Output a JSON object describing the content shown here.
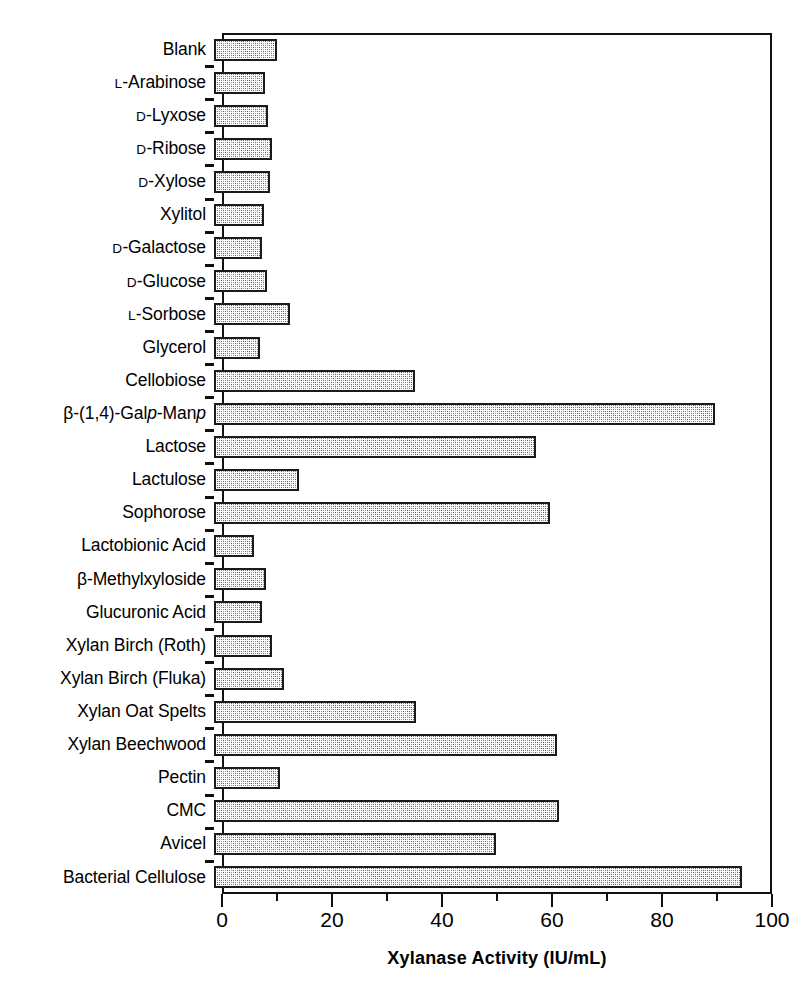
{
  "chart_data": {
    "type": "bar",
    "orientation": "horizontal",
    "title": "",
    "xlabel": "Xylanase Activity (IU/mL)",
    "ylabel": "",
    "xlim": [
      0,
      100
    ],
    "xticks": [
      0,
      20,
      40,
      60,
      80,
      100
    ],
    "xtick_labels": [
      "0",
      "20",
      "40",
      "60",
      "80",
      "100"
    ],
    "minor_xticks": [
      10,
      30,
      50,
      70,
      90
    ],
    "grid": false,
    "legend": null,
    "categories": [
      "Blank",
      "L-Arabinose",
      "D-Lyxose",
      "D-Ribose",
      "D-Xylose",
      "Xylitol",
      "D-Galactose",
      "D-Glucose",
      "L-Sorbose",
      "Glycerol",
      "Cellobiose",
      "β-(1,4)-Galp-Manp",
      "Lactose",
      "Lactulose",
      "Sophorose",
      "Lactobionic Acid",
      "β-Methylxyloside",
      "Glucuronic Acid",
      "Xylan Birch (Roth)",
      "Xylan Birch (Fluka)",
      "Xylan Oat Spelts",
      "Xylan Beechwood",
      "Pectin",
      "CMC",
      "Avicel",
      "Bacterial Cellulose"
    ],
    "values": [
      11.5,
      9.3,
      9.8,
      10.6,
      10.2,
      9.0,
      8.7,
      9.6,
      13.8,
      8.4,
      36.5,
      91.0,
      58.5,
      15.5,
      61.0,
      7.2,
      9.4,
      8.8,
      10.5,
      12.8,
      36.8,
      62.3,
      12.0,
      62.8,
      51.3,
      96.0
    ],
    "series_name": "Xylanase Activity",
    "bar_face_color": "#8e8e8e",
    "bar_edge_color": "#1a1a1a",
    "bar_pattern": "checkerboard"
  },
  "labels": [
    {
      "prefix": "",
      "prefix_smallcaps": false,
      "text": "Blank",
      "italic_chars": []
    },
    {
      "prefix": "L",
      "prefix_smallcaps": true,
      "text": "-Arabinose",
      "italic_chars": []
    },
    {
      "prefix": "D",
      "prefix_smallcaps": true,
      "text": "-Lyxose",
      "italic_chars": []
    },
    {
      "prefix": "D",
      "prefix_smallcaps": true,
      "text": "-Ribose",
      "italic_chars": []
    },
    {
      "prefix": "D",
      "prefix_smallcaps": true,
      "text": "-Xylose",
      "italic_chars": []
    },
    {
      "prefix": "",
      "prefix_smallcaps": false,
      "text": "Xylitol",
      "italic_chars": []
    },
    {
      "prefix": "D",
      "prefix_smallcaps": true,
      "text": "-Galactose",
      "italic_chars": []
    },
    {
      "prefix": "D",
      "prefix_smallcaps": true,
      "text": "-Glucose",
      "italic_chars": []
    },
    {
      "prefix": "L",
      "prefix_smallcaps": true,
      "text": "-Sorbose",
      "italic_chars": []
    },
    {
      "prefix": "",
      "prefix_smallcaps": false,
      "text": "Glycerol",
      "italic_chars": []
    },
    {
      "prefix": "",
      "prefix_smallcaps": false,
      "text": "Cellobiose",
      "italic_chars": []
    },
    {
      "prefix": "",
      "prefix_smallcaps": false,
      "text": "β-(1,4)-Galp-Manp",
      "italic_chars": [
        "p"
      ]
    },
    {
      "prefix": "",
      "prefix_smallcaps": false,
      "text": "Lactose",
      "italic_chars": []
    },
    {
      "prefix": "",
      "prefix_smallcaps": false,
      "text": "Lactulose",
      "italic_chars": []
    },
    {
      "prefix": "",
      "prefix_smallcaps": false,
      "text": "Sophorose",
      "italic_chars": []
    },
    {
      "prefix": "",
      "prefix_smallcaps": false,
      "text": "Lactobionic Acid",
      "italic_chars": []
    },
    {
      "prefix": "",
      "prefix_smallcaps": false,
      "text": "β-Methylxyloside",
      "italic_chars": []
    },
    {
      "prefix": "",
      "prefix_smallcaps": false,
      "text": "Glucuronic Acid",
      "italic_chars": []
    },
    {
      "prefix": "",
      "prefix_smallcaps": false,
      "text": "Xylan Birch (Roth)",
      "italic_chars": []
    },
    {
      "prefix": "",
      "prefix_smallcaps": false,
      "text": "Xylan Birch (Fluka)",
      "italic_chars": []
    },
    {
      "prefix": "",
      "prefix_smallcaps": false,
      "text": "Xylan Oat Spelts",
      "italic_chars": []
    },
    {
      "prefix": "",
      "prefix_smallcaps": false,
      "text": "Xylan Beechwood",
      "italic_chars": []
    },
    {
      "prefix": "",
      "prefix_smallcaps": false,
      "text": "Pectin",
      "italic_chars": []
    },
    {
      "prefix": "",
      "prefix_smallcaps": false,
      "text": "CMC",
      "italic_chars": []
    },
    {
      "prefix": "",
      "prefix_smallcaps": false,
      "text": "Avicel",
      "italic_chars": []
    },
    {
      "prefix": "",
      "prefix_smallcaps": false,
      "text": "Bacterial Cellulose",
      "italic_chars": []
    }
  ]
}
